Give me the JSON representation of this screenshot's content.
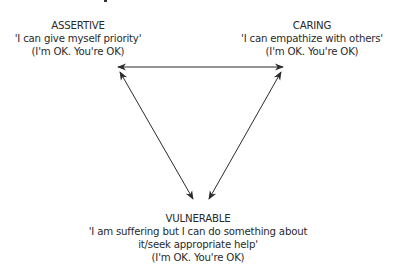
{
  "nodes": {
    "assertive": {
      "title": "ASSERTIVE",
      "quote": "'I can give myself priority'",
      "position": "(I'm OK. You're OK)"
    },
    "caring": {
      "title": "CARING",
      "quote": "'I can empathize with others'",
      "position": "(I'm OK. You're OK)"
    },
    "vulnerable": {
      "title": "VULNERABLE",
      "quote_line1": "'I am suffering but I can do something about",
      "quote_line2": "it/seek appropriate help'",
      "position": "(I'm OK. You're OK)"
    }
  },
  "edges": [
    {
      "from": "assertive",
      "to": "caring",
      "arrows": "both"
    },
    {
      "from": "assertive",
      "to": "vulnerable",
      "arrows": "both"
    },
    {
      "from": "caring",
      "to": "vulnerable",
      "arrows": "both"
    }
  ],
  "colors": {
    "line": "#2b2b2b",
    "text": "#2a2a2a",
    "background": "#ffffff"
  }
}
